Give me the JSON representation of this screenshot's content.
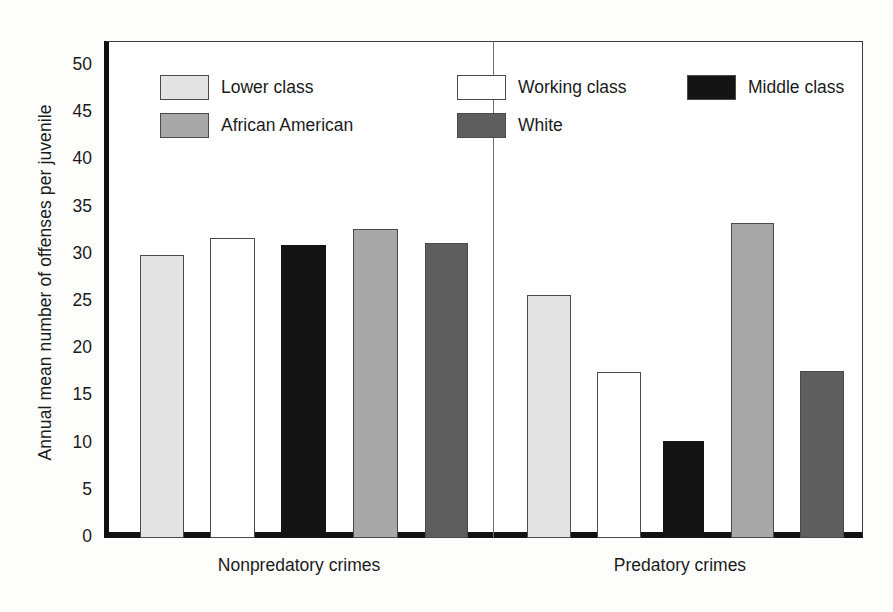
{
  "chart_data": {
    "type": "bar",
    "title": "",
    "xlabel": "",
    "ylabel": "Annual mean number of offenses per juvenile",
    "ylim": [
      0,
      50
    ],
    "yticks": [
      0,
      5,
      10,
      15,
      20,
      25,
      30,
      35,
      40,
      45,
      50
    ],
    "grid": false,
    "legend_position": "inside-top-left",
    "categories": [
      "Nonpredatory crimes",
      "Predatory crimes"
    ],
    "series": [
      {
        "name": "Lower class",
        "color": "#e3e3e3",
        "values": [
          30.0,
          25.7
        ]
      },
      {
        "name": "Working class",
        "color": "#ffffff",
        "values": [
          31.8,
          17.6
        ]
      },
      {
        "name": "Middle class",
        "color": "#141414",
        "values": [
          31.0,
          10.3
        ]
      },
      {
        "name": "African American",
        "color": "#a8a8a8",
        "values": [
          32.7,
          33.4
        ]
      },
      {
        "name": "White",
        "color": "#5e5e5e",
        "values": [
          31.3,
          17.7
        ]
      }
    ]
  },
  "axis": {
    "y_title": "Annual mean number of offenses per juvenile",
    "tick_labels": [
      "50",
      "45",
      "40",
      "35",
      "30",
      "25",
      "20",
      "15",
      "10",
      "5",
      "0"
    ]
  },
  "legend": {
    "items": [
      {
        "label": "Lower class",
        "swatch": "sw-lower"
      },
      {
        "label": "Working class",
        "swatch": "sw-working"
      },
      {
        "label": "Middle class",
        "swatch": "sw-middle"
      },
      {
        "label": "African American",
        "swatch": "sw-african"
      },
      {
        "label": "White",
        "swatch": "sw-white"
      }
    ]
  },
  "groups": [
    {
      "label": "Nonpredatory crimes"
    },
    {
      "label": "Predatory crimes"
    }
  ]
}
